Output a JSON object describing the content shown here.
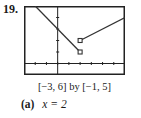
{
  "problem": {
    "number": "19.",
    "window_caption": "[−3, 6] by [−1, 5]",
    "answer": {
      "part_label": "(a)",
      "expression": "x = 2"
    }
  },
  "chart_data": {
    "type": "line",
    "title": "",
    "xlabel": "",
    "ylabel": "",
    "xlim": [
      -3,
      6
    ],
    "ylim": [
      -1,
      5
    ],
    "grid": false,
    "x_ticks": [
      -3,
      -2,
      -1,
      0,
      1,
      2,
      3,
      4,
      5,
      6
    ],
    "y_ticks": [
      -1,
      0,
      1,
      2,
      3,
      4,
      5
    ],
    "series": [
      {
        "name": "left piece",
        "points": [
          [
            -2,
            5
          ],
          [
            2,
            1
          ]
        ],
        "endpoint_marker": {
          "at": [
            2,
            1
          ],
          "style": "open-square"
        }
      },
      {
        "name": "right piece",
        "points": [
          [
            2,
            2
          ],
          [
            6,
            4
          ]
        ],
        "endpoint_marker": {
          "at": [
            2,
            2
          ],
          "style": "open-square"
        }
      }
    ],
    "colors": {
      "line": "#333333",
      "axis": "#222222",
      "frame": "#222222"
    }
  }
}
